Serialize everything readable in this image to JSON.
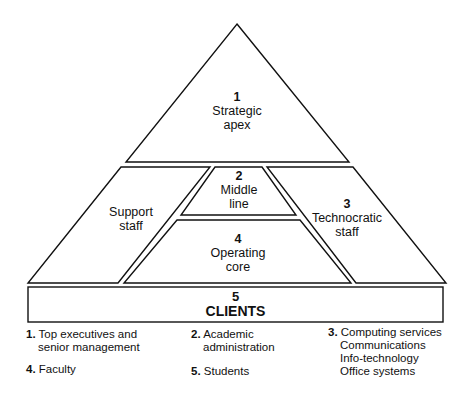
{
  "diagram": {
    "colors": {
      "stroke": "#111111",
      "background": "#ffffff"
    },
    "regions": {
      "strategic_apex": {
        "number": "1",
        "line1": "Strategic",
        "line2": "apex"
      },
      "middle_line": {
        "number": "2",
        "line1": "Middle",
        "line2": "line"
      },
      "technocratic_staff": {
        "number": "3",
        "line1": "Technocratic",
        "line2": "staff"
      },
      "operating_core": {
        "number": "4",
        "line1": "Operating",
        "line2": "core"
      },
      "support_staff": {
        "line1": "Support",
        "line2": "staff"
      },
      "clients": {
        "number": "5",
        "label": "CLIENTS"
      }
    },
    "legend": [
      {
        "num": "1.",
        "lines": [
          "Top executives and",
          "senior management"
        ]
      },
      {
        "num": "2.",
        "lines": [
          "Academic",
          "administration"
        ]
      },
      {
        "num": "3.",
        "lines": [
          "Computing services",
          "Communications",
          "Info-technology",
          "Office systems"
        ]
      },
      {
        "num": "4.",
        "lines": [
          "Faculty"
        ]
      },
      {
        "num": "5.",
        "lines": [
          "Students"
        ]
      }
    ]
  }
}
